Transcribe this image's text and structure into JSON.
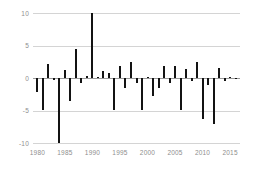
{
  "chart_data": {
    "type": "bar",
    "title": "",
    "subtitle": "",
    "xlabel": "",
    "ylabel": "",
    "grid": true,
    "legend": false,
    "xlim": [
      1979.2,
      2016.8
    ],
    "ylim": [
      -10,
      10
    ],
    "yticks": [
      10,
      5,
      0,
      -5,
      -10
    ],
    "ytick_labels": [
      "10",
      "5",
      "0",
      "-5",
      "-10"
    ],
    "xticks": [
      1980,
      1985,
      1990,
      1995,
      2000,
      2005,
      2010,
      2015
    ],
    "xtick_labels": [
      "1980",
      "1985",
      "1990",
      "1995",
      "2000",
      "2005",
      "2010",
      "2015"
    ],
    "bar_color": "#131313",
    "gridline_color": "#d4d4d4",
    "zeroline_color": "#9a9a9a",
    "axis_text_color": "#8e8e8e",
    "categories": [
      1980,
      1981,
      1982,
      1983,
      1984,
      1985,
      1986,
      1987,
      1988,
      1989,
      1990,
      1991,
      1992,
      1993,
      1994,
      1995,
      1996,
      1997,
      1998,
      1999,
      2000,
      2001,
      2002,
      2003,
      2004,
      2005,
      2006,
      2007,
      2008,
      2009,
      2010,
      2011,
      2012,
      2013,
      2014,
      2015,
      2016
    ],
    "values": [
      -2.2,
      -4.9,
      2.1,
      -0.3,
      -10.0,
      1.3,
      -3.6,
      4.4,
      -0.7,
      0.3,
      10.0,
      0.2,
      1.1,
      0.7,
      -4.9,
      1.9,
      -1.6,
      2.5,
      -0.8,
      -4.9,
      0.2,
      -2.8,
      -1.5,
      1.8,
      -0.8,
      1.9,
      -4.9,
      1.4,
      -0.4,
      2.4,
      -6.3,
      -1.1,
      -7.0,
      1.5,
      -0.5,
      0.1,
      -0.2
    ]
  }
}
